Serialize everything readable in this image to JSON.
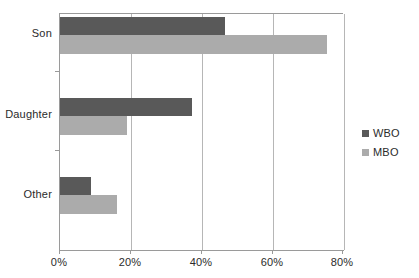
{
  "chart_data": {
    "type": "bar",
    "orientation": "horizontal",
    "title": "",
    "xlabel": "",
    "ylabel": "",
    "categories": [
      "Son",
      "Daughter",
      "Other"
    ],
    "series": [
      {
        "name": "WBO",
        "color": "#595959",
        "values": [
          46.6,
          37.2,
          8.6
        ]
      },
      {
        "name": "MBO",
        "color": "#ababab",
        "values": [
          75.2,
          19.0,
          16.0
        ]
      }
    ],
    "xlim": [
      0,
      80
    ],
    "xticks": [
      0,
      20,
      40,
      60,
      80
    ],
    "xtick_labels": [
      "0%",
      "20%",
      "40%",
      "60%",
      "80%"
    ],
    "grid": true,
    "grid_axis": "x",
    "legend_position": "right"
  },
  "legend": {
    "entries": [
      {
        "label": "WBO",
        "color": "#595959"
      },
      {
        "label": "MBO",
        "color": "#ababab"
      }
    ]
  },
  "axis": {
    "x_tick_labels": [
      "0%",
      "20%",
      "40%",
      "60%",
      "80%"
    ],
    "y_category_labels": [
      "Son",
      "Daughter",
      "Other"
    ]
  },
  "colors": {
    "wbo": "#595959",
    "mbo": "#ababab",
    "gridline": "#b6b6b6",
    "axis": "#9a9a9a",
    "text": "#2b2b2b",
    "background": "#ffffff"
  }
}
